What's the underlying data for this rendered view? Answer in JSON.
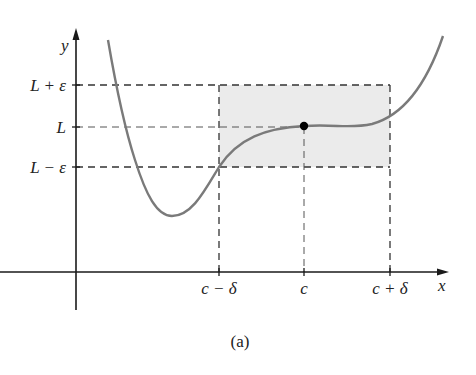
{
  "figure": {
    "caption": "(a)",
    "axes": {
      "x_label": "x",
      "y_label": "y"
    },
    "y_ticks": [
      {
        "label": "L + ε",
        "y": 85
      },
      {
        "label": "L",
        "y": 127
      },
      {
        "label": "L − ε",
        "y": 167
      }
    ],
    "x_ticks": [
      {
        "label": "c − δ",
        "x": 219
      },
      {
        "label": "c",
        "x": 304
      },
      {
        "label": "c + δ",
        "x": 390
      }
    ],
    "point": {
      "label": "(c, L)"
    },
    "colors": {
      "curve": "#7a7a7a",
      "shade": "#ebebeb",
      "axes": "#1a1a1a",
      "dashes": "#333333"
    }
  }
}
